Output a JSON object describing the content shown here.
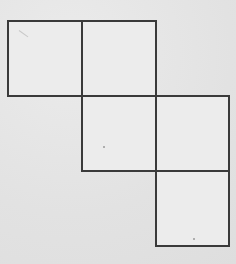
{
  "diagram": {
    "type": "square-net",
    "cell_size_px": 74,
    "line_color": "#3a3a3a",
    "fill_color": "#ececec",
    "background_color": "#e4e4e4",
    "squares": [
      {
        "row": 0,
        "col": 0,
        "x": 7,
        "y": 20
      },
      {
        "row": 0,
        "col": 1,
        "x": 81,
        "y": 20
      },
      {
        "row": 1,
        "col": 1,
        "x": 81,
        "y": 95
      },
      {
        "row": 1,
        "col": 2,
        "x": 155,
        "y": 95
      },
      {
        "row": 2,
        "col": 2,
        "x": 155,
        "y": 170
      }
    ],
    "marks": [
      {
        "x": 103,
        "y": 146
      },
      {
        "x": 193,
        "y": 238
      }
    ]
  }
}
